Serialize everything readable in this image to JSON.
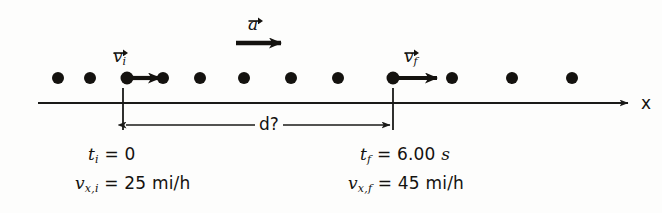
{
  "figure": {
    "type": "motion-diagram",
    "axis": {
      "label": "x",
      "direction": "right"
    },
    "dimension": {
      "label": "d?"
    },
    "vectors": [
      {
        "name": "initial-velocity",
        "symbol": "v",
        "subscript": "i",
        "at_x": 123
      },
      {
        "name": "acceleration",
        "symbol": "a",
        "subscript": "",
        "at_x": 253
      },
      {
        "name": "final-velocity",
        "symbol": "v",
        "subscript": "f",
        "at_x": 393
      }
    ],
    "left_annotation": {
      "time_symbol": "t",
      "time_subscript": "i",
      "time_value": "= 0",
      "velocity_symbol": "v",
      "velocity_subscript": "x,i",
      "velocity_value": "= 25 mi/h"
    },
    "right_annotation": {
      "time_symbol": "t",
      "time_subscript": "f",
      "time_value": "= 6.00",
      "time_unit": "s",
      "velocity_symbol": "v",
      "velocity_subscript": "x,f",
      "velocity_value": "= 45 mi/h"
    },
    "dots": {
      "count": 12,
      "radius": 6,
      "y": 78,
      "x_positions": [
        58,
        90,
        127,
        163,
        200,
        244,
        291,
        338,
        393,
        452,
        512,
        572
      ]
    },
    "colors": {
      "ink": "#14120f",
      "line": "#1a1a18",
      "background": "#fdfdfc"
    }
  }
}
